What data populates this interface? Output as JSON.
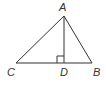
{
  "diagram": {
    "type": "geometry-triangle",
    "stroke_color": "#333333",
    "points": {
      "A": {
        "label": "A",
        "x": 64,
        "y": 16
      },
      "B": {
        "label": "B",
        "x": 92,
        "y": 63
      },
      "C": {
        "label": "C",
        "x": 16,
        "y": 63
      },
      "D": {
        "label": "D",
        "x": 64,
        "y": 63
      }
    },
    "segments": [
      "AB",
      "AC",
      "CB",
      "AD"
    ],
    "right_angle_at": "D"
  }
}
